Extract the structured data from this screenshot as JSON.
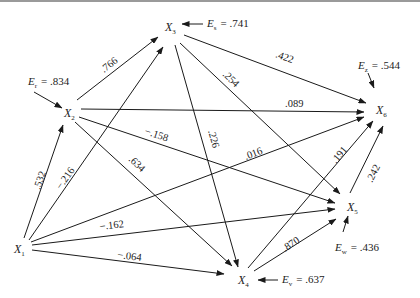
{
  "nodes": [
    {
      "id": "X1",
      "base": "X",
      "sub": "1",
      "x": 20,
      "y": 249
    },
    {
      "id": "X2",
      "base": "X",
      "sub": "2",
      "x": 72,
      "y": 113
    },
    {
      "id": "X3",
      "base": "X",
      "sub": "3",
      "x": 172,
      "y": 27
    },
    {
      "id": "X4",
      "base": "X",
      "sub": "4",
      "x": 240,
      "y": 280
    },
    {
      "id": "X5",
      "base": "X",
      "sub": "5",
      "x": 350,
      "y": 207
    },
    {
      "id": "X6",
      "base": "X",
      "sub": "6",
      "x": 376,
      "y": 110
    }
  ],
  "paths": [
    {
      "from": "X1",
      "to": "X2",
      "coef": ".532"
    },
    {
      "from": "X1",
      "to": "X3",
      "coef": "−.216"
    },
    {
      "from": "X1",
      "to": "X6",
      "coef": ".016"
    },
    {
      "from": "X1",
      "to": "X5",
      "coef": "−.162"
    },
    {
      "from": "X1",
      "to": "X4",
      "coef": "−.064"
    },
    {
      "from": "X2",
      "to": "X3",
      "coef": ".766"
    },
    {
      "from": "X2",
      "to": "X6",
      "coef": ".089"
    },
    {
      "from": "X2",
      "to": "X5",
      "coef": "−.158"
    },
    {
      "from": "X2",
      "to": "X4",
      "coef": ".634"
    },
    {
      "from": "X3",
      "to": "X6",
      "coef": ".422"
    },
    {
      "from": "X3",
      "to": "X5",
      "coef": ".254"
    },
    {
      "from": "X3",
      "to": "X4",
      "coef": ".226"
    },
    {
      "from": "X4",
      "to": "X6",
      "coef": ".191"
    },
    {
      "from": "X4",
      "to": "X5",
      "coef": ".870"
    },
    {
      "from": "X5",
      "to": "X6",
      "coef": ".242"
    }
  ],
  "errors": [
    {
      "target": "X2",
      "label": "E",
      "sub": "r",
      "value": ".834"
    },
    {
      "target": "X3",
      "label": "E",
      "sub": "s",
      "value": ".741"
    },
    {
      "target": "X6",
      "label": "E",
      "sub": "z",
      "value": ".544"
    },
    {
      "target": "X5",
      "label": "E",
      "sub": "w",
      "value": ".436"
    },
    {
      "target": "X4",
      "label": "E",
      "sub": "v",
      "value": ".637"
    }
  ],
  "labels": {
    "e_r": "= .834",
    "e_s": "= .741",
    "e_z": "= .544",
    "e_w": "= .436",
    "e_v": "= .637",
    "c_532": ".532",
    "c_216": "−.216",
    "c_016": ".016",
    "c_162": "−.162",
    "c_064": "−.064",
    "c_766": ".766",
    "c_089": ".089",
    "c_158": "−.158",
    "c_634": ".634",
    "c_422": ".422",
    "c_254": ".254",
    "c_226": ".226",
    "c_191": ".191",
    "c_870": ".870",
    "c_242": ".242",
    "x": "X",
    "e": "E",
    "s1": "1",
    "s2": "2",
    "s3": "3",
    "s4": "4",
    "s5": "5",
    "s6": "6",
    "sr": "r",
    "ss": "s",
    "sz": "z",
    "sw": "w",
    "sv": "v"
  }
}
